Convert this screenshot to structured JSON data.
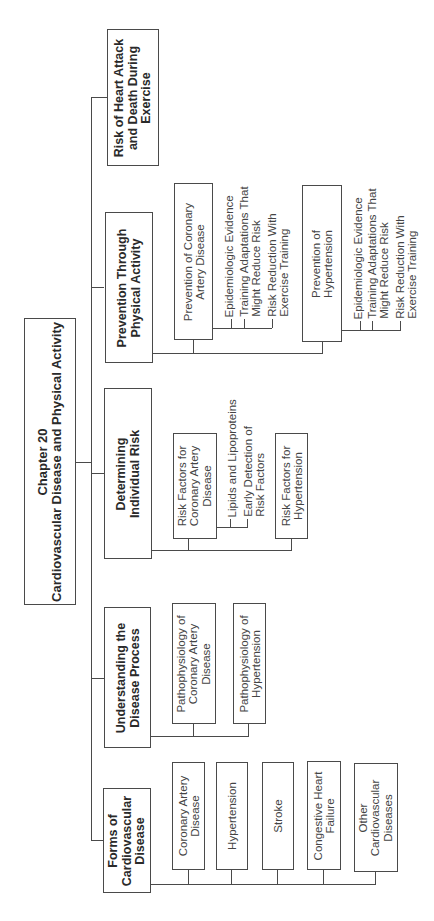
{
  "root": {
    "line1": "Chapter 20",
    "line2": "Cardiovascular Disease and Physical Activity"
  },
  "sections": [
    {
      "id": "forms",
      "label": "Forms of\nCardiovascular\nDisease",
      "children": [
        {
          "label": "Coronary Artery\nDisease"
        },
        {
          "label": "Hypertension"
        },
        {
          "label": "Stroke"
        },
        {
          "label": "Congestive Heart\nFailure"
        },
        {
          "label": "Other\nCardiovascular\nDiseases"
        }
      ]
    },
    {
      "id": "understanding",
      "label": "Understanding the\nDisease Process",
      "children": [
        {
          "label": "Pathophysiology of\nCoronary Artery\nDisease"
        },
        {
          "label": "Pathophysiology of\nHypertension"
        }
      ]
    },
    {
      "id": "determining",
      "label": "Determining\nIndividual Risk",
      "children": [
        {
          "label": "Risk Factors for\nCoronary Artery\nDisease",
          "subitems": [
            "Lipids and Lipoproteins",
            "Early Detection of\nRisk Factors"
          ]
        },
        {
          "label": "Risk Factors for\nHypertension"
        }
      ]
    },
    {
      "id": "prevention",
      "label": "Prevention Through\nPhysical Activity",
      "children": [
        {
          "label": "Prevention of Coronary\nArtery Disease",
          "subitems": [
            "Epidemiologic Evidence",
            "Training Adaptations That\nMight Reduce Risk",
            "Risk Reduction With\nExercise Training"
          ]
        },
        {
          "label": "Prevention of\nHypertension",
          "subitems": [
            "Epidemiologic Evidence",
            "Training Adaptations That\nMight Reduce Risk",
            "Risk Reduction With\nExercise Training"
          ]
        }
      ]
    },
    {
      "id": "risk",
      "label": "Risk of Heart Attack\nand Death During\nExercise",
      "children": []
    }
  ],
  "colors": {
    "line": "#4a4a4a",
    "text": "#3a3a3a",
    "background": "#ffffff"
  }
}
